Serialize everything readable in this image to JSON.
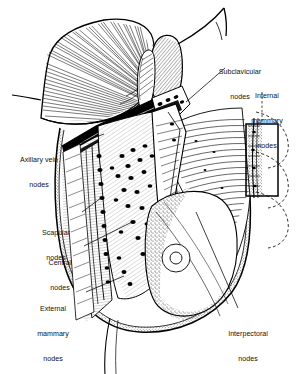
{
  "figure": {
    "background_color": "#ffffff",
    "ink_color": "#000000",
    "width": 301,
    "height": 374
  },
  "labels": [
    {
      "id": "subclavicular",
      "name": "label-subclavicular-nodes",
      "line1": "Subclavicular",
      "line2": "nodes",
      "x": 205,
      "y": 52,
      "w": 70,
      "align": "center"
    },
    {
      "id": "internal_mammary",
      "name": "label-internal-mammary-nodes",
      "line1": "Internal",
      "line2": "mammary",
      "line3": "nodes",
      "x": 236,
      "y": 76,
      "w": 62,
      "align": "center"
    },
    {
      "id": "axillary_vein",
      "name": "label-axillary-vein-nodes",
      "line1": "Axillary vein",
      "line2": "nodes",
      "x": 8,
      "y": 140,
      "w": 62,
      "align": "center"
    },
    {
      "id": "scapular",
      "name": "label-scapular-nodes",
      "line1": "Scapular",
      "line2": "nodes",
      "x": 31,
      "y": 213,
      "w": 50,
      "align": "center"
    },
    {
      "id": "central",
      "name": "label-central-nodes",
      "line1": "Central",
      "line2": "nodes",
      "x": 37,
      "y": 243,
      "w": 46,
      "align": "center"
    },
    {
      "id": "external_mammary",
      "name": "label-external-mammary-nodes",
      "line1": "External",
      "line2": "mammary",
      "line3": "nodes",
      "x": 22,
      "y": 289,
      "w": 62,
      "align": "center"
    },
    {
      "id": "interpectoral",
      "name": "label-interpectoral-nodes",
      "line1": "Interpectoral",
      "line2": "nodes",
      "x": 215,
      "y": 314,
      "w": 66,
      "align": "center"
    }
  ],
  "structures": [
    {
      "id": "pectoralis-major",
      "label": "pectoralis major muscle (reflected)"
    },
    {
      "id": "pectoralis-minor",
      "label": "pectoralis minor muscle (reflected)"
    },
    {
      "id": "axillary-vein",
      "label": "axillary vein"
    },
    {
      "id": "chest-wall",
      "label": "chest wall / rib cage"
    },
    {
      "id": "breast",
      "label": "breast"
    },
    {
      "id": "areola",
      "label": "areola"
    },
    {
      "id": "nipple",
      "label": "nipple"
    },
    {
      "id": "internal-mammary-inset",
      "label": "internal mammary inset box"
    },
    {
      "id": "lymph-nodes",
      "label": "lymph nodes"
    }
  ]
}
